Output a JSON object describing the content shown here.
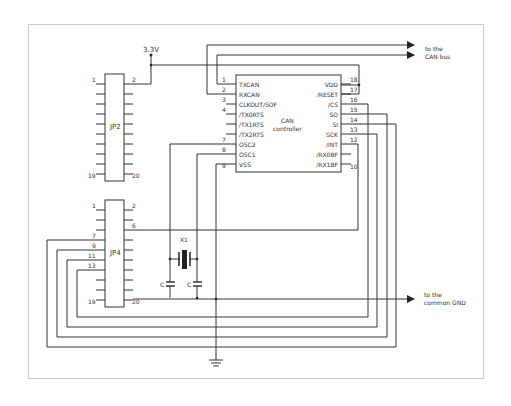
{
  "power": {
    "label": "3.3V"
  },
  "jp2": {
    "name": "JP2",
    "pin_tl": "1",
    "pin_tr": "2",
    "pin_bl": "19",
    "pin_br": "20"
  },
  "jp4": {
    "name": "JP4",
    "pins": {
      "p1": "1",
      "p2": "2",
      "p6": "6",
      "p7": "7",
      "p9": "9",
      "p11": "11",
      "p13": "13",
      "p19": "19",
      "p20": "20"
    }
  },
  "ic": {
    "title_line1": "CAN",
    "title_line2": "controller",
    "left_pins": [
      {
        "num": "1",
        "name": "TXCAN"
      },
      {
        "num": "2",
        "name": "RXCAN"
      },
      {
        "num": "3",
        "name": "CLKOUT/SOF"
      },
      {
        "num": "4",
        "name": "/TX0RTS"
      },
      {
        "num": "",
        "name": "/TX1RTS"
      },
      {
        "num": "",
        "name": "/TX2RTS"
      },
      {
        "num": "7",
        "name": "OSC2"
      },
      {
        "num": "8",
        "name": "OSC1"
      },
      {
        "num": "9",
        "name": "VSS"
      }
    ],
    "right_pins": [
      {
        "num": "18",
        "name": "VDD"
      },
      {
        "num": "17",
        "name": "/RESET"
      },
      {
        "num": "16",
        "name": "/CS"
      },
      {
        "num": "15",
        "name": "SO"
      },
      {
        "num": "14",
        "name": "SI"
      },
      {
        "num": "13",
        "name": "SCK"
      },
      {
        "num": "12",
        "name": "/INT"
      },
      {
        "num": "",
        "name": "/RX0BF"
      },
      {
        "num": "10",
        "name": "/RX1BF"
      }
    ]
  },
  "crystal": {
    "label": "X1"
  },
  "caps": {
    "c1": "C",
    "c2": "C"
  },
  "arrows": {
    "can_line1": "to the",
    "can_line2": "CAN bus",
    "gnd_line1": "to the",
    "gnd_line2": "common GND"
  }
}
